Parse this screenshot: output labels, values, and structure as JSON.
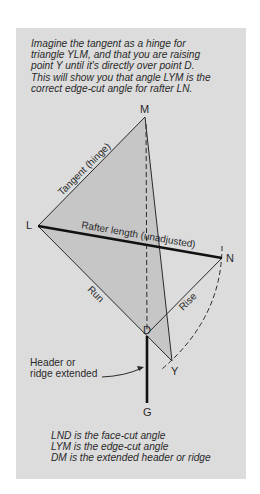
{
  "caption": {
    "lines": [
      "Imagine the tangent as a hinge for",
      "triangle YLM, and that you are raising",
      "point Y until it's directly over point D.",
      "This will show you that angle LYM is the",
      "correct edge-cut angle for rafter LN."
    ]
  },
  "points": {
    "M": {
      "label": "M",
      "x": 145,
      "y": 117
    },
    "L": {
      "label": "L",
      "x": 38,
      "y": 226
    },
    "N": {
      "label": "N",
      "x": 222,
      "y": 258
    },
    "D": {
      "label": "D",
      "x": 147,
      "y": 334
    },
    "Y": {
      "label": "Y",
      "x": 172,
      "y": 361
    },
    "G": {
      "label": "G",
      "x": 147,
      "y": 403
    }
  },
  "line_labels": {
    "tangent": "Tangent (hinge)",
    "rafter": "Rafter length (unadjusted)",
    "run": "Run",
    "rise": "Rise"
  },
  "callout": {
    "lines": [
      "Header or",
      "ridge extended"
    ]
  },
  "legend": {
    "lines": [
      "LND is the face-cut angle",
      "LYM is the edge-cut angle",
      "DM is the extended header or ridge"
    ]
  },
  "colors": {
    "panel": "#dcdcdc",
    "shade": "#c4c4c4",
    "line": "#2a2a2a"
  }
}
